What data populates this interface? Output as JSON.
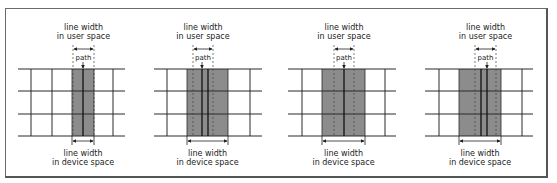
{
  "figure": {
    "border_color": "#6a6a6a",
    "band_color": "#8c8c8c",
    "grid_color": "#2a2a2a",
    "labels": {
      "user_line1": "line width",
      "user_line2": "in user space",
      "path": "path",
      "device_line1": "line width",
      "device_line2": "in device space"
    },
    "grid_rows_y": [
      69,
      91,
      114,
      136
    ],
    "panels": [
      {
        "id": 1,
        "line_start": 18,
        "line_end": 125,
        "grid_cols": [
          31,
          52,
          113
        ],
        "band": [
          72,
          94
        ],
        "user_width": [
          73,
          94
        ],
        "path_lines": [
          83
        ],
        "path_x": 83
      },
      {
        "id": 2,
        "line_start": 154,
        "line_end": 262,
        "grid_cols": [
          167,
          250
        ],
        "band": [
          187,
          228
        ],
        "user_width": [
          193,
          213
        ],
        "path_lines": [
          202,
          208
        ],
        "path_x": 202
      },
      {
        "id": 3,
        "line_start": 288,
        "line_end": 396,
        "grid_cols": [
          302,
          385
        ],
        "band": [
          322,
          365
        ],
        "user_width": [
          334,
          354
        ],
        "path_lines": [
          344
        ],
        "path_x": 344
      },
      {
        "id": 4,
        "line_start": 425,
        "line_end": 533,
        "grid_cols": [
          439,
          522
        ],
        "band": [
          459,
          501
        ],
        "user_width": [
          475,
          496
        ],
        "path_lines": [
          481,
          487
        ],
        "path_x": 487
      }
    ]
  }
}
